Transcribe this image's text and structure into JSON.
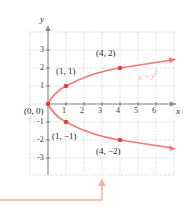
{
  "figure": {
    "kind": "cartesian-graph",
    "equation_label": "x = y",
    "equation_exponent": "2",
    "axes": {
      "x_label": "x",
      "y_label": "y",
      "x_ticks": [
        "1",
        "2",
        "3",
        "4",
        "5",
        "6"
      ],
      "y_ticks": [
        "3",
        "2",
        "1",
        "-1",
        "-2",
        "-3"
      ],
      "x_range": [
        -1,
        7
      ],
      "y_range": [
        -4,
        4
      ],
      "grid": true,
      "grid_style": "dotted"
    },
    "points": [
      {
        "label": "(0, 0)",
        "x": 0,
        "y": 0
      },
      {
        "label": "(1, 1)",
        "x": 1,
        "y": 1
      },
      {
        "label": "(4, 2)",
        "x": 4,
        "y": 2
      },
      {
        "label": "(1, −1)",
        "x": 1,
        "y": -1
      },
      {
        "label": "(4, −2)",
        "x": 4,
        "y": -2
      }
    ],
    "colors": {
      "curve": "#ef7b72",
      "marker": "#d9453c",
      "grid": "#bcbcbc",
      "axis": "#8a8a8a",
      "callout": "#f0b0a8",
      "text": "#231f20",
      "equation_text": "#e8a79e"
    },
    "callout": {
      "present": true,
      "arrow_direction": "up"
    }
  }
}
